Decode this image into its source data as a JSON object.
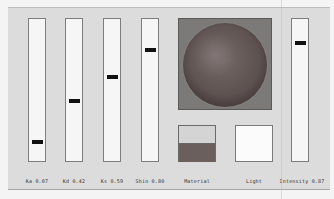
{
  "sliders": [
    {
      "id": "ka",
      "label": "Ka 0.07",
      "value": 0.07
    },
    {
      "id": "kd",
      "label": "Kd 0.42",
      "value": 0.42
    },
    {
      "id": "ks",
      "label": "Ks 0.59",
      "value": 0.59
    },
    {
      "id": "shin",
      "label": "Shin 0.80",
      "value": 0.8
    }
  ],
  "intensity": {
    "label": "Intensity 0.87",
    "value": 0.87
  },
  "preview": {
    "label": "sphere-preview"
  },
  "material": {
    "label": "Material",
    "top_color": "#d4d4d4",
    "bottom_color": "#6b5f5d"
  },
  "light": {
    "label": "Light",
    "color": "#fbfbfb"
  }
}
